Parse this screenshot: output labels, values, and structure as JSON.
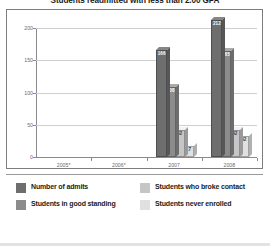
{
  "chart_data": {
    "type": "bar",
    "title": "Students readmitted with less than 2.00 GPA",
    "xlabel": "",
    "ylabel": "",
    "categories": [
      "2005*",
      "2006*",
      "2007",
      "2008"
    ],
    "ylim": [
      0,
      200
    ],
    "yticks": [
      0,
      50,
      100,
      150,
      200
    ],
    "ytick_labels": [
      "0",
      "50",
      "100",
      "150",
      "200"
    ],
    "grid": true,
    "legend_position": "bottom",
    "series": [
      {
        "name": "Number of admits",
        "color": "#6e6e6e",
        "values": [
          null,
          null,
          166,
          212
        ],
        "labels": [
          "",
          "",
          "166",
          "212"
        ]
      },
      {
        "name": "Students in good standing",
        "color": "#8c8c8c",
        "values": [
          null,
          null,
          108,
          165
        ],
        "labels": [
          "",
          "",
          "108",
          "165"
        ]
      },
      {
        "name": "Students who broke contact",
        "color": "#c6c6c6",
        "values": [
          null,
          null,
          42,
          42
        ],
        "labels": [
          "",
          "",
          "42",
          "42"
        ]
      },
      {
        "name": "Students never enrolled",
        "color": "#e0e0e0",
        "values": [
          null,
          null,
          17,
          32
        ],
        "labels": [
          "",
          "",
          "17",
          "32"
        ]
      }
    ]
  },
  "legend": {
    "items": [
      {
        "label": "Number of admits",
        "color": "#6e6e6e"
      },
      {
        "label": "Students who broke contact",
        "color": "#c6c6c6"
      },
      {
        "label": "Students in good standing",
        "color": "#8c8c8c"
      },
      {
        "label": "Students never enrolled",
        "color": "#e0e0e0"
      }
    ]
  },
  "axis": {
    "y_labels": [
      "200",
      "150",
      "100",
      "50",
      "0"
    ],
    "x_labels": [
      "2005*",
      "2006*",
      "2007",
      "2008"
    ]
  }
}
